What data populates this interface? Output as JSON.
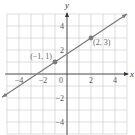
{
  "chart_data": {
    "type": "line",
    "title": "",
    "xlabel": "x",
    "ylabel": "y",
    "xlim": [
      -5,
      5
    ],
    "ylim": [
      -5,
      5
    ],
    "grid": true,
    "grid_step": 1,
    "x_ticks": [
      {
        "value": -4,
        "label": "-4"
      },
      {
        "value": -2,
        "label": "-2"
      },
      {
        "value": 0,
        "label": "0"
      },
      {
        "value": 2,
        "label": "2"
      },
      {
        "value": 4,
        "label": "4"
      }
    ],
    "y_ticks": [
      {
        "value": 4,
        "label": "4"
      },
      {
        "value": 2,
        "label": "2"
      },
      {
        "value": -2,
        "label": "-2"
      },
      {
        "value": -4,
        "label": "-4"
      }
    ],
    "series": [
      {
        "name": "line",
        "equation": "y = (2/3)x + 5/3",
        "slope": 0.6667,
        "intercept": 1.6667,
        "x_range": [
          -5,
          5
        ],
        "arrows_both_ends": true
      }
    ],
    "points": [
      {
        "x": -1,
        "y": 1,
        "label": "(−1, 1)",
        "label_side": "left"
      },
      {
        "x": 2,
        "y": 3,
        "label": "(2, 3)",
        "label_side": "right"
      }
    ],
    "colors": {
      "grid": "#c8c8c8",
      "axis": "#333333",
      "line": "#7a7a7a",
      "text": "#555555"
    }
  }
}
